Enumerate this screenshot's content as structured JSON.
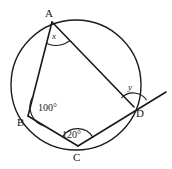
{
  "figure": {
    "type": "circle-geometry-diagram",
    "stroke_color": "#1a1a1a",
    "fill_color": "#ffffff",
    "circle": {
      "center_x": 76,
      "center_y": 85,
      "radius": 65
    },
    "vertices": [
      {
        "name": "A",
        "label": "A",
        "x": 52,
        "y": 22,
        "label_x": 45,
        "label_y": 8
      },
      {
        "name": "B",
        "label": "B",
        "x": 28,
        "y": 116,
        "label_x": 17,
        "label_y": 117
      },
      {
        "name": "C",
        "label": "C",
        "x": 78,
        "y": 146,
        "label_x": 73,
        "label_y": 152
      },
      {
        "name": "D",
        "label": "D",
        "x": 134,
        "y": 107,
        "label_x": 136,
        "label_y": 108
      }
    ],
    "chords": [
      {
        "name": "chord-AB",
        "from": "A",
        "to": "B"
      },
      {
        "name": "chord-AD",
        "from": "A",
        "to": "D"
      },
      {
        "name": "chord-BC",
        "from": "B",
        "to": "C"
      },
      {
        "name": "chord-CD",
        "from": "C",
        "to": "D"
      }
    ],
    "extended_line": {
      "name": "line-CD-extended",
      "from": "C",
      "through": "D",
      "end_x": 166,
      "end_y": 92
    },
    "angles": [
      {
        "name": "angle-at-A",
        "vertex": "A",
        "label": "x",
        "is_variable": true,
        "label_x": 52,
        "label_y": 32
      },
      {
        "name": "angle-at-B",
        "vertex": "B",
        "label": "100°",
        "is_variable": false,
        "label_x": 38,
        "label_y": 103
      },
      {
        "name": "angle-at-C",
        "vertex": "C",
        "label": "120°",
        "is_variable": false,
        "label_x": 62,
        "label_y": 130
      },
      {
        "name": "angle-at-D",
        "vertex": "D",
        "label": "y",
        "is_variable": true,
        "label_x": 128,
        "label_y": 83
      }
    ]
  }
}
